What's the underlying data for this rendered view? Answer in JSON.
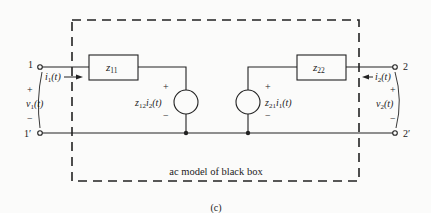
{
  "diagram": {
    "caption": "(c)",
    "box_label": "ac model of black box",
    "terminals": {
      "t1": "1",
      "t1p": "1′",
      "t2": "2",
      "t2p": "2′"
    },
    "impedances": {
      "z11": "z",
      "z11_sub": "11",
      "z22": "z",
      "z22_sub": "22"
    },
    "sources": {
      "left": {
        "coef": "z",
        "coef_sub": "12",
        "var": "i",
        "var_sub": "2",
        "arg": "(t)",
        "plus": "+",
        "minus": "−"
      },
      "right": {
        "coef": "z",
        "coef_sub": "21",
        "var": "i",
        "var_sub": "1",
        "arg": "(t)",
        "plus": "+",
        "minus": "−"
      }
    },
    "port1": {
      "current": "i",
      "current_sub": "1",
      "current_arg": "(t)",
      "voltage": "v",
      "voltage_sub": "1",
      "voltage_arg": "(t)",
      "plus": "+",
      "minus": "−"
    },
    "port2": {
      "current": "i",
      "current_sub": "2",
      "current_arg": "(t)",
      "voltage": "v",
      "voltage_sub": "2",
      "voltage_arg": "(t)",
      "plus": "+",
      "minus": "−"
    }
  }
}
